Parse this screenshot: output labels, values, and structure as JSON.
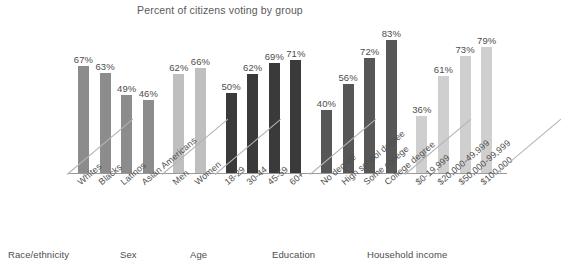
{
  "chart_data": {
    "type": "bar",
    "title": "Percent of citizens voting by group",
    "xlabel": "",
    "ylabel": "",
    "ylim": [
      0,
      90
    ],
    "grid": false,
    "legend": "none",
    "value_suffix": "%",
    "categories": [
      "Whites",
      "Blacks",
      "Latinos",
      "Asian Americans",
      "Men",
      "Women",
      "18-29",
      "30-44",
      "45-59",
      "60+",
      "No degree",
      "High school degree",
      "Some college",
      "College degree",
      "$0-19,999",
      "$20,000-49,999",
      "$50,000-99,999",
      "$100,000"
    ],
    "values": [
      67,
      63,
      49,
      46,
      62,
      66,
      50,
      62,
      69,
      71,
      40,
      56,
      72,
      83,
      36,
      61,
      73,
      79
    ],
    "value_labels": [
      "67%",
      "63%",
      "49%",
      "46%",
      "62%",
      "66%",
      "50%",
      "62%",
      "69%",
      "71%",
      "40%",
      "56%",
      "72%",
      "83%",
      "36%",
      "61%",
      "73%",
      "79%"
    ],
    "groups": [
      {
        "name": "Race/ethnicity",
        "color": "#8c8c8c",
        "categories": [
          "Whites",
          "Blacks",
          "Latinos",
          "Asian Americans"
        ],
        "values": [
          67,
          63,
          49,
          46
        ]
      },
      {
        "name": "Sex",
        "color": "#bfbfbf",
        "categories": [
          "Men",
          "Women"
        ],
        "values": [
          62,
          66
        ]
      },
      {
        "name": "Age",
        "color": "#3a3a3a",
        "categories": [
          "18-29",
          "30-44",
          "45-59",
          "60+"
        ],
        "values": [
          50,
          62,
          69,
          71
        ]
      },
      {
        "name": "Education",
        "color": "#575757",
        "categories": [
          "No degree",
          "High school degree",
          "Some college",
          "College degree"
        ],
        "values": [
          40,
          56,
          72,
          83
        ]
      },
      {
        "name": "Household income",
        "color": "#cfcfcf",
        "categories": [
          "$0-19,999",
          "$20,000-49,999",
          "$50,000-99,999",
          "$100,000"
        ],
        "values": [
          36,
          61,
          73,
          79
        ]
      }
    ]
  },
  "bars": [
    {
      "label": "67%",
      "tick": "Whites",
      "group": "Race/ethnicity",
      "color": "#8c8c8c"
    },
    {
      "label": "63%",
      "tick": "Blacks",
      "group": "Race/ethnicity",
      "color": "#8c8c8c"
    },
    {
      "label": "49%",
      "tick": "Latinos",
      "group": "Race/ethnicity",
      "color": "#8c8c8c"
    },
    {
      "label": "46%",
      "tick": "Asian Americans",
      "group": "Race/ethnicity",
      "color": "#8c8c8c"
    },
    {
      "label": "62%",
      "tick": "Men",
      "group": "Sex",
      "color": "#bfbfbf"
    },
    {
      "label": "66%",
      "tick": "Women",
      "group": "Sex",
      "color": "#bfbfbf"
    },
    {
      "label": "50%",
      "tick": "18-29",
      "group": "Age",
      "color": "#3a3a3a"
    },
    {
      "label": "62%",
      "tick": "30-44",
      "group": "Age",
      "color": "#3a3a3a"
    },
    {
      "label": "69%",
      "tick": "45-59",
      "group": "Age",
      "color": "#3a3a3a"
    },
    {
      "label": "71%",
      "tick": "60+",
      "group": "Age",
      "color": "#3a3a3a"
    },
    {
      "label": "40%",
      "tick": "No degree",
      "group": "Education",
      "color": "#575757"
    },
    {
      "label": "56%",
      "tick": "High school degree",
      "group": "Education",
      "color": "#575757"
    },
    {
      "label": "72%",
      "tick": "Some college",
      "group": "Education",
      "color": "#575757"
    },
    {
      "label": "83%",
      "tick": "College degree",
      "group": "Education",
      "color": "#575757"
    },
    {
      "label": "36%",
      "tick": "$0-19,999",
      "group": "Household income",
      "color": "#cfcfcf"
    },
    {
      "label": "61%",
      "tick": "$20,000-49,999",
      "group": "Household income",
      "color": "#cfcfcf"
    },
    {
      "label": "73%",
      "tick": "$50,000-99,999",
      "group": "Household income",
      "color": "#cfcfcf"
    },
    {
      "label": "79%",
      "tick": "$100,000",
      "group": "Household income",
      "color": "#cfcfcf"
    }
  ],
  "group_names": [
    "Race/ethnicity",
    "Sex",
    "Age",
    "Education",
    "Household income"
  ]
}
